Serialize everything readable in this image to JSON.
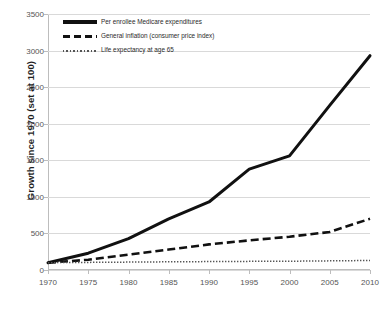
{
  "chart_data": {
    "type": "line",
    "title": "",
    "xlabel": "",
    "ylabel": "Growth since 1970 (set at 100)",
    "x": [
      1970,
      1975,
      1980,
      1985,
      1990,
      1995,
      2000,
      2005,
      2010
    ],
    "xtick_labels": [
      "1970",
      "1975",
      "1980",
      "1985",
      "1990",
      "1995",
      "2000",
      "2005",
      "2010"
    ],
    "xlim": [
      1970,
      2010
    ],
    "ylim": [
      0,
      3500
    ],
    "ytick_labels": [
      "0",
      "500",
      "1000",
      "1500",
      "2000",
      "2500",
      "3000",
      "3500"
    ],
    "yticks": [
      0,
      500,
      1000,
      1500,
      2000,
      2500,
      3000,
      3500
    ],
    "grid": "horizontal",
    "legend_position": "inside top-left",
    "series": [
      {
        "name": "Per enrollee Medicare expenditures",
        "style": "solid",
        "color": "#111111",
        "values": [
          100,
          230,
          430,
          700,
          930,
          1380,
          1560,
          2250,
          2930
        ]
      },
      {
        "name": "General inflation (consumer price index)",
        "style": "dashed",
        "color": "#111111",
        "values": [
          100,
          140,
          210,
          280,
          350,
          405,
          455,
          520,
          700
        ]
      },
      {
        "name": "Life expectancy at age 65",
        "style": "dotted",
        "color": "#555555",
        "values": [
          100,
          104,
          108,
          112,
          115,
          118,
          120,
          125,
          130
        ]
      }
    ]
  },
  "legend": {
    "items": [
      {
        "label": "Per enrollee Medicare expenditures",
        "swatch": "solid-line-swatch"
      },
      {
        "label": "General inflation (consumer price index)",
        "swatch": "dashed-line-swatch"
      },
      {
        "label": "Life expectancy at age 65",
        "swatch": "dotted-line-swatch"
      }
    ]
  },
  "top_crop": {
    "text": ""
  }
}
